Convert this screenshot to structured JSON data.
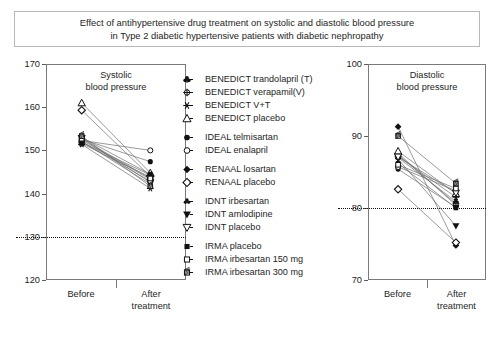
{
  "title": {
    "line1": "Effect of antihypertensive drug treatment on systolic and diastolic blood pressure",
    "line2": "in Type 2  diabetic hypertensive patients with diabetic nephropathy"
  },
  "legend": {
    "items": [
      {
        "label": "BENEDICT trandolapril (T)",
        "marker": "club-filled",
        "group": 0
      },
      {
        "label": "BENEDICT verapamil(V)",
        "marker": "circle-cross",
        "group": 0
      },
      {
        "label": "BENEDICT V+T",
        "marker": "star",
        "group": 0
      },
      {
        "label": "BENEDICT placebo",
        "marker": "triangle-open",
        "group": 0
      },
      {
        "label": "IDEAL telmisartan",
        "marker": "circle-filled",
        "group": 1
      },
      {
        "label": "IDEAL enalapril",
        "marker": "circle-open",
        "group": 1
      },
      {
        "label": "RENAAL losartan",
        "marker": "diamond-filled",
        "group": 2
      },
      {
        "label": "RENAAL placebo",
        "marker": "diamond-open",
        "group": 2
      },
      {
        "label": "IDNT irbesartan",
        "marker": "club-small",
        "group": 3
      },
      {
        "label": "IDNT amlodipine",
        "marker": "triangle-down-filled",
        "group": 3
      },
      {
        "label": "IDNT placebo",
        "marker": "triangle-down-open",
        "group": 3
      },
      {
        "label": "IRMA placebo",
        "marker": "square-filled",
        "group": 4
      },
      {
        "label": "IRMA irbesartan 150 mg",
        "marker": "square-open",
        "group": 4
      },
      {
        "label": "IRMA irbesartan 300 mg",
        "marker": "square-hatched",
        "group": 4
      }
    ]
  },
  "chart_data": [
    {
      "id": "systolic",
      "type": "line",
      "title": "Systolic\nblood pressure",
      "title_line1": "Systolic",
      "title_line2": "blood pressure",
      "xlabel": "",
      "ylabel": "",
      "categories": [
        "Before",
        "After"
      ],
      "xtick_labels": [
        "Before",
        "After treatment"
      ],
      "xlabel_after_line1": "After",
      "xlabel_after_line2": "treatment",
      "ylim": [
        120,
        170
      ],
      "yticks": [
        120,
        130,
        140,
        150,
        160,
        170
      ],
      "reference_line": 130,
      "grid": false,
      "series": [
        {
          "name": "BENEDICT trandolapril (T)",
          "marker": "club-filled",
          "values": [
            151.6,
            143.8
          ]
        },
        {
          "name": "BENEDICT verapamil(V)",
          "marker": "circle-cross",
          "values": [
            151.9,
            144.3
          ]
        },
        {
          "name": "BENEDICT V+T",
          "marker": "star",
          "values": [
            151.4,
            141.2
          ]
        },
        {
          "name": "BENEDICT placebo",
          "marker": "triangle-open",
          "values": [
            161.0,
            144.8
          ]
        },
        {
          "name": "IDEAL telmisartan",
          "marker": "circle-filled",
          "values": [
            152.6,
            147.4
          ]
        },
        {
          "name": "IDEAL enalapril",
          "marker": "circle-open",
          "values": [
            152.3,
            150.0
          ]
        },
        {
          "name": "RENAAL losartan",
          "marker": "diamond-filled",
          "values": [
            152.0,
            142.9
          ]
        },
        {
          "name": "RENAAL placebo",
          "marker": "diamond-open",
          "values": [
            159.3,
            144.0
          ]
        },
        {
          "name": "IDNT irbesartan",
          "marker": "club-small",
          "values": [
            152.4,
            143.3
          ]
        },
        {
          "name": "IDNT amlodipine",
          "marker": "triangle-down-filled",
          "values": [
            152.1,
            142.2
          ]
        },
        {
          "name": "IDNT placebo",
          "marker": "triangle-down-open",
          "values": [
            152.8,
            142.6
          ]
        },
        {
          "name": "IRMA placebo",
          "marker": "square-filled",
          "values": [
            153.0,
            144.5
          ]
        },
        {
          "name": "IRMA irbesartan 150 mg",
          "marker": "square-open",
          "values": [
            152.7,
            143.5
          ]
        },
        {
          "name": "IRMA irbesartan 300 mg",
          "marker": "square-hatched",
          "values": [
            153.3,
            141.7
          ]
        }
      ]
    },
    {
      "id": "diastolic",
      "type": "line",
      "title": "Diastolic\nblood pressure",
      "title_line1": "Diastolic",
      "title_line2": "blood pressure",
      "xlabel": "",
      "ylabel": "",
      "categories": [
        "Before",
        "After"
      ],
      "xtick_labels": [
        "Before",
        "After treatment"
      ],
      "xlabel_after_line1": "After",
      "xlabel_after_line2": "treatment",
      "ylim": [
        70,
        100
      ],
      "yticks": [
        70,
        80,
        90,
        100
      ],
      "reference_line": 80,
      "grid": false,
      "series": [
        {
          "name": "BENEDICT trandolapril (T)",
          "marker": "club-filled",
          "values": [
            87.6,
            80.4
          ]
        },
        {
          "name": "BENEDICT verapamil(V)",
          "marker": "circle-cross",
          "values": [
            87.4,
            80.6
          ]
        },
        {
          "name": "BENEDICT V+T",
          "marker": "star",
          "values": [
            87.2,
            81.5
          ]
        },
        {
          "name": "BENEDICT placebo",
          "marker": "triangle-open",
          "values": [
            87.9,
            82.0
          ]
        },
        {
          "name": "IDEAL telmisartan",
          "marker": "circle-filled",
          "values": [
            85.4,
            80.1
          ]
        },
        {
          "name": "IDEAL enalapril",
          "marker": "circle-open",
          "values": [
            85.7,
            82.4
          ]
        },
        {
          "name": "RENAAL losartan",
          "marker": "diamond-filled",
          "values": [
            91.3,
            74.8
          ]
        },
        {
          "name": "RENAAL placebo",
          "marker": "diamond-open",
          "values": [
            82.6,
            75.2
          ]
        },
        {
          "name": "IDNT irbesartan",
          "marker": "club-small",
          "values": [
            87.0,
            80.9
          ]
        },
        {
          "name": "IDNT amlodipine",
          "marker": "triangle-down-filled",
          "values": [
            86.8,
            77.5
          ]
        },
        {
          "name": "IDNT placebo",
          "marker": "triangle-down-open",
          "values": [
            87.1,
            82.1
          ]
        },
        {
          "name": "IRMA placebo",
          "marker": "square-filled",
          "values": [
            86.2,
            80.0
          ]
        },
        {
          "name": "IRMA irbesartan 150 mg",
          "marker": "square-open",
          "values": [
            86.0,
            82.7
          ]
        },
        {
          "name": "IRMA irbesartan 300 mg",
          "marker": "square-hatched",
          "values": [
            90.0,
            83.4
          ]
        }
      ]
    }
  ]
}
